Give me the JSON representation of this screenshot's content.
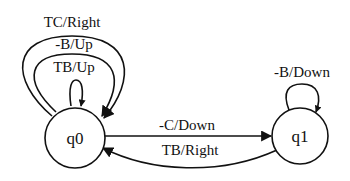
{
  "diagram": {
    "type": "finite-state-machine",
    "colors": {
      "stroke": "#111111",
      "background": "#ffffff"
    },
    "states": [
      {
        "id": "q0",
        "label": "q0"
      },
      {
        "id": "q1",
        "label": "q1"
      }
    ],
    "transitions": [
      {
        "from": "q0",
        "to": "q0",
        "label": "TC/Right"
      },
      {
        "from": "q0",
        "to": "q0",
        "label": "-B/Up"
      },
      {
        "from": "q0",
        "to": "q0",
        "label": "TB/Up"
      },
      {
        "from": "q0",
        "to": "q1",
        "label": "-C/Down"
      },
      {
        "from": "q1",
        "to": "q0",
        "label": "TB/Right"
      },
      {
        "from": "q1",
        "to": "q1",
        "label": "-B/Down"
      }
    ]
  }
}
